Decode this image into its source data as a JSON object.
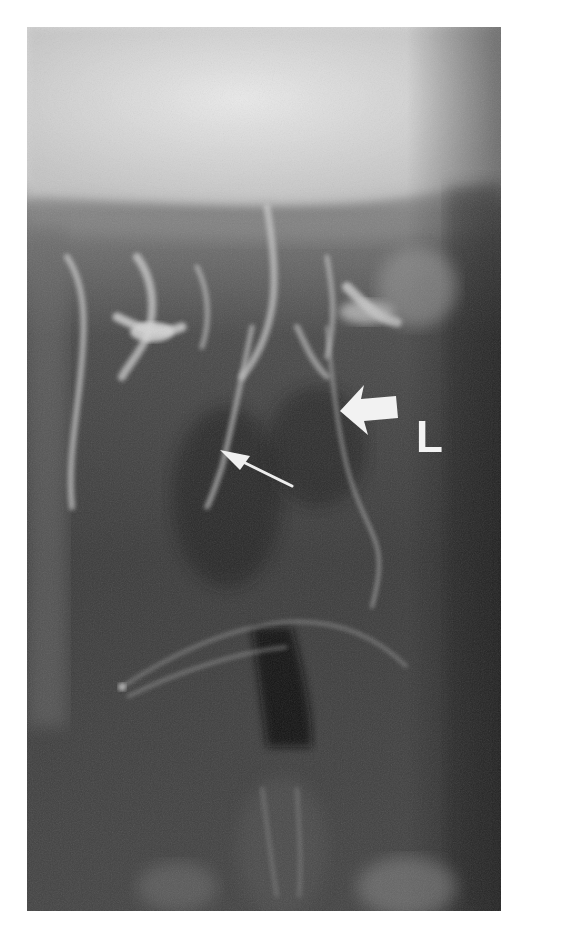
{
  "figure": {
    "type": "radiograph",
    "modality": "X-ray",
    "background_color": "#ffffff",
    "annotations": {
      "side_marker": {
        "text": "L"
      },
      "large_arrow": {
        "direction": "left"
      },
      "small_arrow": {
        "direction": "up-left"
      }
    }
  }
}
